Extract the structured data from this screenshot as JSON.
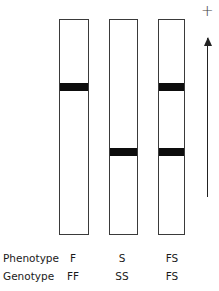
{
  "diagram": {
    "type": "electrophoresis-gel",
    "direction_symbol": "+",
    "lanes": [
      {
        "phenotype": "F",
        "genotype": "FF",
        "bands": [
          "fast"
        ]
      },
      {
        "phenotype": "S",
        "genotype": "SS",
        "bands": [
          "slow"
        ]
      },
      {
        "phenotype": "FS",
        "genotype": "FS",
        "bands": [
          "fast",
          "slow"
        ]
      }
    ]
  },
  "labels": {
    "phenotype_label": "Phenotype",
    "genotype_label": "Genotype"
  }
}
